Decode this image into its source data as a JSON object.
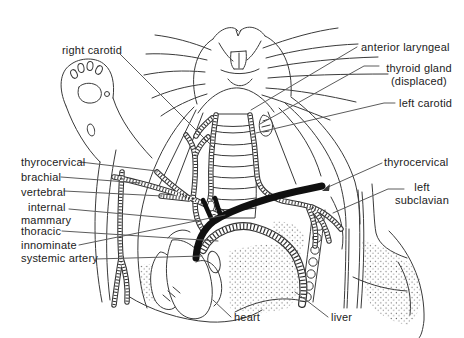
{
  "figure": {
    "type": "anatomical-line-diagram",
    "colors": {
      "background": "#ffffff",
      "line": "#3a3a3a",
      "leader_line": "#5c5c5c",
      "label_text": "#222222",
      "highlighted_artery": "#101010"
    }
  },
  "labels": {
    "right_carotid": "right carotid",
    "anterior_laryngeal": "anterior laryngeal",
    "thyroid_gland": "thyroid gland",
    "thyroid_gland_note": "(displaced)",
    "left_carotid": "left carotid",
    "thyrocervical_left": "thyrocervical",
    "brachial": "brachial",
    "vertebral": "vertebral",
    "internal_mammary_line1": "internal",
    "internal_mammary_line2": "mammary",
    "thoracic": "thoracic",
    "innominate": "innominate",
    "systemic_artery": "systemic artery",
    "thyrocervical_right": "thyrocervical",
    "left_subclavian_line1": "left",
    "left_subclavian_line2": "subclavian",
    "heart": "heart",
    "liver": "liver"
  }
}
